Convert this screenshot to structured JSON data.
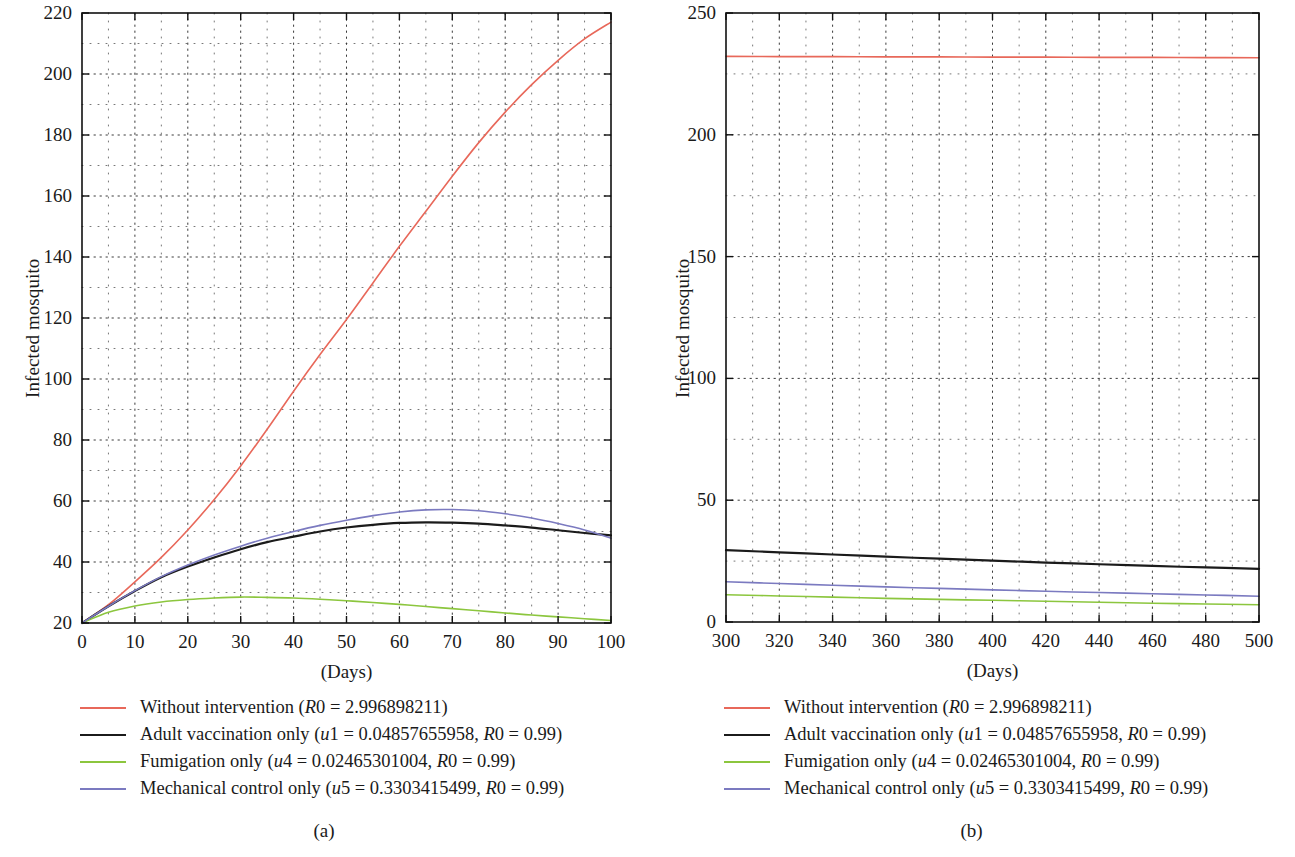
{
  "figure": {
    "panels": [
      {
        "caption": "(a)",
        "ylabel": "Infected mosquito",
        "xlabel": "(Days)"
      },
      {
        "caption": "(b)",
        "ylabel": "Infected mosquito",
        "xlabel": "(Days)"
      }
    ],
    "legend_entries": [
      {
        "label": "Without intervention (R0 = 2.996898211)",
        "color": "#e8685a",
        "width": 1.6
      },
      {
        "label": "Adult vaccination only (u1 = 0.04857655958, R0 = 0.99)",
        "color": "#1b1b1b",
        "width": 2.2
      },
      {
        "label": "Fumigation only (u4 = 0.02465301004, R0 = 0.99)",
        "color": "#8cc63e",
        "width": 1.6
      },
      {
        "label": "Mechanical control only (u5 = 0.3303415499, R0 = 0.99)",
        "color": "#7b7ac0",
        "width": 1.6
      }
    ]
  },
  "chart_data": [
    {
      "type": "line",
      "panel": "(a)",
      "title": "",
      "xlabel": "(Days)",
      "ylabel": "Infected mosquito",
      "xlim": [
        0,
        100
      ],
      "ylim": [
        20,
        220
      ],
      "xticks": [
        0,
        10,
        20,
        30,
        40,
        50,
        60,
        70,
        80,
        90,
        100
      ],
      "yticks": [
        20,
        40,
        60,
        80,
        100,
        120,
        140,
        160,
        180,
        200,
        220
      ],
      "grid": true,
      "legend_position": "below",
      "x": [
        0,
        5,
        10,
        15,
        20,
        25,
        30,
        35,
        40,
        45,
        50,
        55,
        60,
        65,
        70,
        75,
        80,
        85,
        90,
        95,
        100
      ],
      "series": [
        {
          "name": "Without intervention (R0 = 2.996898211)",
          "color": "#e8685a",
          "values": [
            20,
            26,
            33.5,
            41.5,
            50.5,
            60.5,
            71.5,
            83.5,
            96,
            108,
            119.5,
            131.5,
            143.5,
            155,
            166.5,
            177.5,
            187.5,
            196.5,
            204.5,
            211.5,
            217
          ]
        },
        {
          "name": "Adult vaccination only (u1 = 0.04857655958, R0 = 0.99)",
          "color": "#1b1b1b",
          "values": [
            20,
            25.5,
            30.5,
            35,
            38.5,
            41.5,
            44.2,
            46.5,
            48.3,
            50,
            51.3,
            52.2,
            52.8,
            53,
            52.9,
            52.6,
            52,
            51.3,
            50.4,
            49.5,
            48.7
          ]
        },
        {
          "name": "Fumigation only (u4 = 0.02465301004, R0 = 0.99)",
          "color": "#8cc63e",
          "values": [
            20,
            23.5,
            25.6,
            26.9,
            27.7,
            28.2,
            28.5,
            28.4,
            28.2,
            27.8,
            27.3,
            26.7,
            26.1,
            25.4,
            24.7,
            24,
            23.3,
            22.6,
            22,
            21.4,
            20.8
          ]
        },
        {
          "name": "Mechanical control only (u5 = 0.3303415499, R0 = 0.99)",
          "color": "#7b7ac0",
          "values": [
            20,
            25.5,
            30.6,
            35.2,
            39,
            42.3,
            45.2,
            47.8,
            50,
            52,
            53.7,
            55.2,
            56.4,
            57.1,
            57.2,
            56.8,
            55.8,
            54.4,
            52.6,
            50.5,
            47.8
          ]
        }
      ]
    },
    {
      "type": "line",
      "panel": "(b)",
      "title": "",
      "xlabel": "(Days)",
      "ylabel": "Infected mosquito",
      "xlim": [
        300,
        500
      ],
      "ylim": [
        0,
        250
      ],
      "xticks": [
        300,
        320,
        340,
        360,
        380,
        400,
        420,
        440,
        460,
        480,
        500
      ],
      "yticks": [
        0,
        50,
        100,
        150,
        200,
        250
      ],
      "grid": true,
      "legend_position": "below",
      "x": [
        300,
        320,
        340,
        360,
        380,
        400,
        420,
        440,
        460,
        480,
        500
      ],
      "series": [
        {
          "name": "Without intervention (R0 = 2.996898211)",
          "color": "#e8685a",
          "values": [
            232.2,
            232.1,
            232.1,
            232.0,
            232.0,
            231.9,
            231.9,
            231.8,
            231.8,
            231.7,
            231.6
          ]
        },
        {
          "name": "Adult vaccination only (u1 = 0.04857655958, R0 = 0.99)",
          "color": "#1b1b1b",
          "values": [
            29.5,
            28.6,
            27.7,
            26.8,
            26.0,
            25.2,
            24.4,
            23.7,
            23.0,
            22.4,
            21.8
          ]
        },
        {
          "name": "Fumigation only (u4 = 0.02465301004, R0 = 0.99)",
          "color": "#8cc63e",
          "values": [
            11.2,
            10.7,
            10.2,
            9.7,
            9.3,
            8.9,
            8.5,
            8.1,
            7.7,
            7.4,
            7.1
          ]
        },
        {
          "name": "Mechanical control only (u5 = 0.3303415499, R0 = 0.99)",
          "color": "#7b7ac0",
          "values": [
            16.5,
            15.8,
            15.1,
            14.4,
            13.8,
            13.2,
            12.6,
            12.1,
            11.6,
            11.1,
            10.6
          ]
        }
      ]
    }
  ]
}
